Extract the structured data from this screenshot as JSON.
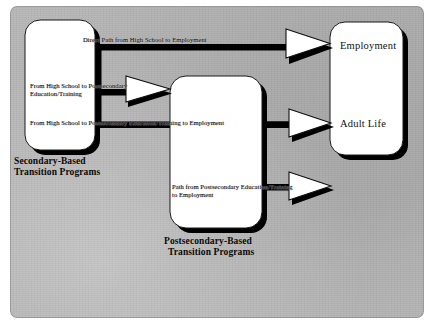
{
  "figure": {
    "kind": "flow-diagram",
    "background_color": "#b3b3b3",
    "page_color": "#ffffff",
    "ink_color": "#000000",
    "node_fill": "#ffffff"
  },
  "nodes": [
    {
      "id": "secondary",
      "label": "",
      "caption": "Secondary-Based\nTransition Programs",
      "caption_line_1": "Secondary-Based",
      "caption_line_2": "Transition Programs"
    },
    {
      "id": "postsecondary",
      "label": "",
      "caption": "Postsecondary-Based\nTransition Programs",
      "caption_line_1": "Postsecondary-Based",
      "caption_line_2": "Transition Programs"
    },
    {
      "id": "outcomes",
      "label_top": "Employment",
      "label_bottom": "Adult Life"
    }
  ],
  "edges": [
    {
      "id": "direct-employment",
      "label": "Direct Path from High School to Employment",
      "from": "secondary",
      "to": "outcomes"
    },
    {
      "id": "hs-to-postsecondary",
      "label_line_1": "From High School to Postsecondary",
      "label_line_2": "Education/Training",
      "label": "From High School to Postsecondary\nEducation/Training",
      "from": "secondary",
      "to": "postsecondary"
    },
    {
      "id": "hs-through-postsecondary-to-employment",
      "label": "From High School to Postsecondary Education/Training to Employment",
      "from": "secondary",
      "to": "outcomes"
    },
    {
      "id": "postsecondary-to-employment",
      "label_line_1": "Path from Postsecondary Education/Training",
      "label_line_2": "to Employment",
      "label": "Path from Postsecondary Education/Training\nto Employment",
      "from": "postsecondary",
      "to": "outcomes"
    }
  ]
}
